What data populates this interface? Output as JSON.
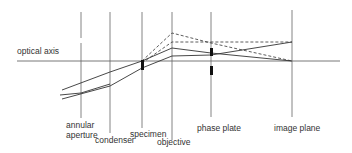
{
  "diagram": {
    "labels": {
      "optical_axis": "optical axis",
      "annular_aperture_line1": "annular",
      "annular_aperture_line2": "aperture",
      "condenser": "condenser",
      "specimen": "specimen",
      "objective": "objective",
      "phase_plate": "phase plate",
      "image_plane": "image plane"
    },
    "colors": {
      "line": "#333333",
      "axis": "#555555",
      "plane": "#666666",
      "text": "#333333"
    },
    "legend_semantics": {
      "solid_rays": "direct (undiffracted) light",
      "dashed_rays": "diffracted light"
    }
  }
}
